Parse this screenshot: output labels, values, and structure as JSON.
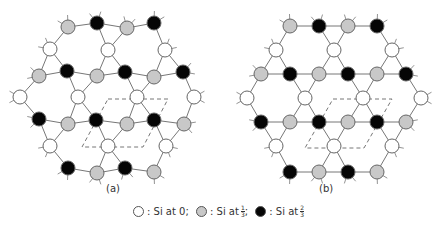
{
  "colors": {
    "white_atom": "#ffffff",
    "gray_atom": "#c8c8c8",
    "black_atom": "#050505",
    "stroke": "#666666",
    "bond": "#777777",
    "dash": "#777777"
  },
  "panels": [
    {
      "label": "(a)",
      "label_pos": [
        113,
        192
      ],
      "unit_cell": [
        [
          108,
          99
        ],
        [
          168,
          99
        ],
        [
          143,
          147
        ],
        [
          82,
          147
        ]
      ],
      "atoms": [
        {
          "x": 68,
          "y": 27,
          "t": "g"
        },
        {
          "x": 97,
          "y": 23,
          "t": "b"
        },
        {
          "x": 127,
          "y": 28,
          "t": "g"
        },
        {
          "x": 154,
          "y": 23,
          "t": "b"
        },
        {
          "x": 50,
          "y": 49,
          "t": "w"
        },
        {
          "x": 108,
          "y": 50,
          "t": "w"
        },
        {
          "x": 165,
          "y": 50,
          "t": "w"
        },
        {
          "x": 39,
          "y": 76,
          "t": "g"
        },
        {
          "x": 67,
          "y": 71,
          "t": "b"
        },
        {
          "x": 97,
          "y": 76,
          "t": "g"
        },
        {
          "x": 125,
          "y": 72,
          "t": "b"
        },
        {
          "x": 154,
          "y": 77,
          "t": "g"
        },
        {
          "x": 183,
          "y": 72,
          "t": "b"
        },
        {
          "x": 20,
          "y": 97,
          "t": "w"
        },
        {
          "x": 78,
          "y": 97,
          "t": "w"
        },
        {
          "x": 137,
          "y": 97,
          "t": "w"
        },
        {
          "x": 194,
          "y": 97,
          "t": "w"
        },
        {
          "x": 39,
          "y": 119,
          "t": "b"
        },
        {
          "x": 68,
          "y": 124,
          "t": "g"
        },
        {
          "x": 96,
          "y": 120,
          "t": "b"
        },
        {
          "x": 127,
          "y": 124,
          "t": "g"
        },
        {
          "x": 154,
          "y": 120,
          "t": "b"
        },
        {
          "x": 184,
          "y": 124,
          "t": "g"
        },
        {
          "x": 50,
          "y": 146,
          "t": "w"
        },
        {
          "x": 108,
          "y": 146,
          "t": "w"
        },
        {
          "x": 166,
          "y": 146,
          "t": "w"
        },
        {
          "x": 68,
          "y": 168,
          "t": "b"
        },
        {
          "x": 97,
          "y": 173,
          "t": "g"
        },
        {
          "x": 125,
          "y": 168,
          "t": "b"
        },
        {
          "x": 154,
          "y": 172,
          "t": "g"
        }
      ]
    },
    {
      "label": "(b)",
      "label_pos": [
        326,
        192
      ],
      "unit_cell": [
        [
          333,
          99
        ],
        [
          392,
          99
        ],
        [
          364,
          148
        ],
        [
          305,
          148
        ]
      ],
      "atoms": [
        {
          "x": 290,
          "y": 26,
          "t": "g"
        },
        {
          "x": 319,
          "y": 26,
          "t": "b"
        },
        {
          "x": 348,
          "y": 26,
          "t": "g"
        },
        {
          "x": 377,
          "y": 26,
          "t": "b"
        },
        {
          "x": 276,
          "y": 50,
          "t": "w"
        },
        {
          "x": 334,
          "y": 50,
          "t": "w"
        },
        {
          "x": 392,
          "y": 50,
          "t": "w"
        },
        {
          "x": 261,
          "y": 74,
          "t": "g"
        },
        {
          "x": 290,
          "y": 74,
          "t": "b"
        },
        {
          "x": 319,
          "y": 74,
          "t": "g"
        },
        {
          "x": 348,
          "y": 74,
          "t": "b"
        },
        {
          "x": 377,
          "y": 74,
          "t": "g"
        },
        {
          "x": 406,
          "y": 74,
          "t": "b"
        },
        {
          "x": 247,
          "y": 98,
          "t": "w"
        },
        {
          "x": 305,
          "y": 98,
          "t": "w"
        },
        {
          "x": 363,
          "y": 98,
          "t": "w"
        },
        {
          "x": 421,
          "y": 98,
          "t": "w"
        },
        {
          "x": 261,
          "y": 122,
          "t": "b"
        },
        {
          "x": 290,
          "y": 122,
          "t": "g"
        },
        {
          "x": 319,
          "y": 122,
          "t": "b"
        },
        {
          "x": 348,
          "y": 122,
          "t": "g"
        },
        {
          "x": 377,
          "y": 122,
          "t": "b"
        },
        {
          "x": 406,
          "y": 122,
          "t": "g"
        },
        {
          "x": 276,
          "y": 146,
          "t": "w"
        },
        {
          "x": 334,
          "y": 146,
          "t": "w"
        },
        {
          "x": 392,
          "y": 146,
          "t": "w"
        },
        {
          "x": 290,
          "y": 172,
          "t": "b"
        },
        {
          "x": 319,
          "y": 172,
          "t": "g"
        },
        {
          "x": 348,
          "y": 172,
          "t": "b"
        },
        {
          "x": 377,
          "y": 172,
          "t": "g"
        }
      ]
    }
  ],
  "legend": {
    "items": [
      {
        "type": "w",
        "text": ": Si at 0;",
        "frac": null
      },
      {
        "type": "g",
        "text": ": Si at",
        "frac": [
          "1",
          "3"
        ],
        "suffix": ";"
      },
      {
        "type": "b",
        "text": ": Si at",
        "frac": [
          "2",
          "3"
        ],
        "suffix": ""
      }
    ]
  }
}
